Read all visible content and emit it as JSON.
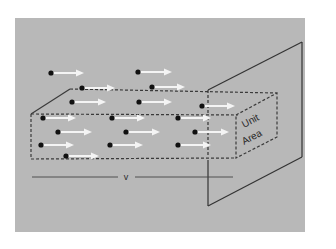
{
  "diagram": {
    "colors": {
      "background": "#ffffff",
      "panel": "#b8b8b8",
      "line": "#333333",
      "dash": "#3a3a3a",
      "arrow": "#f4f4f4",
      "particle": "#111111"
    },
    "labels": {
      "unit_area_line1": "Unit",
      "unit_area_line2": "Area",
      "velocity": "v"
    },
    "particles": [
      {
        "x": 51,
        "y": 73,
        "len": 33
      },
      {
        "x": 138,
        "y": 72,
        "len": 34
      },
      {
        "x": 82,
        "y": 88,
        "len": 33
      },
      {
        "x": 152,
        "y": 87,
        "len": 33
      },
      {
        "x": 72,
        "y": 102,
        "len": 34
      },
      {
        "x": 139,
        "y": 102,
        "len": 33
      },
      {
        "x": 202,
        "y": 106,
        "len": 33
      },
      {
        "x": 43,
        "y": 118,
        "len": 33
      },
      {
        "x": 112,
        "y": 118,
        "len": 33
      },
      {
        "x": 178,
        "y": 118,
        "len": 33
      },
      {
        "x": 58,
        "y": 132,
        "len": 34
      },
      {
        "x": 126,
        "y": 132,
        "len": 34
      },
      {
        "x": 195,
        "y": 132,
        "len": 34
      },
      {
        "x": 41,
        "y": 145,
        "len": 33
      },
      {
        "x": 110,
        "y": 145,
        "len": 33
      },
      {
        "x": 178,
        "y": 145,
        "len": 33
      },
      {
        "x": 66,
        "y": 156,
        "len": 33
      }
    ]
  }
}
